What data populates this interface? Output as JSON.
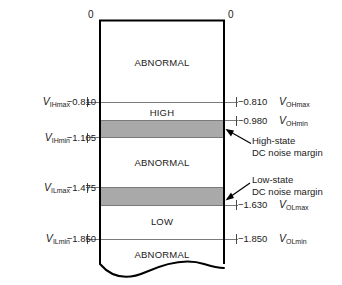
{
  "figure": {
    "type": "voltage-level-diagram",
    "units": "volts",
    "axis_top_label_left": "0",
    "axis_top_label_right": "0",
    "band_fill_color": "#a9a9a9",
    "line_color": "#808080",
    "outline_color": "#000000",
    "zones": [
      {
        "name": "abnormal-top",
        "label": "ABNORMAL",
        "top_v": 0.0,
        "bottom_v": -0.81
      },
      {
        "name": "high",
        "label": "HIGH",
        "top_v": -0.81,
        "bottom_v": -0.98
      },
      {
        "name": "abnormal-middle",
        "label": "ABNORMAL",
        "top_v": -1.105,
        "bottom_v": -1.475
      },
      {
        "name": "low",
        "label": "LOW",
        "top_v": -1.63,
        "bottom_v": -1.85
      },
      {
        "name": "abnormal-bottom",
        "label": "ABNORMAL",
        "top_v": -1.85,
        "bottom_v": null
      }
    ],
    "noise_margin_bands": [
      {
        "name": "high-state-noise-margin",
        "top_v": -0.98,
        "bottom_v": -1.105
      },
      {
        "name": "low-state-noise-margin",
        "top_v": -1.475,
        "bottom_v": -1.63
      }
    ],
    "left_levels": [
      {
        "var_base": "V",
        "var_sub": "IHmax",
        "value": "−0.810"
      },
      {
        "var_base": "V",
        "var_sub": "IHmin",
        "value": "−1.105"
      },
      {
        "var_base": "V",
        "var_sub": "ILmax",
        "value": "−1.475"
      },
      {
        "var_base": "V",
        "var_sub": "ILmin",
        "value": "−1.850"
      }
    ],
    "right_levels": [
      {
        "var_base": "V",
        "var_sub": "OHmax",
        "value": "−0.810"
      },
      {
        "var_base": "V",
        "var_sub": "OHmin",
        "value": "−0.980"
      },
      {
        "var_base": "V",
        "var_sub": "OLmax",
        "value": "−1.630"
      },
      {
        "var_base": "V",
        "var_sub": "OLmin",
        "value": "−1.850"
      }
    ],
    "callouts": [
      {
        "name": "high-state-noise-margin-callout",
        "line1": "High-state",
        "line2": "DC noise margin"
      },
      {
        "name": "low-state-noise-margin-callout",
        "line1": "Low-state",
        "line2": "DC noise margin"
      }
    ]
  }
}
